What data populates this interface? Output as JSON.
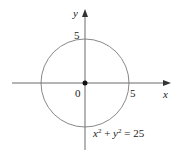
{
  "diagram": {
    "x_axis_label": "x",
    "y_axis_label": "y",
    "origin_label": "0",
    "x_tick_label": "5",
    "y_tick_label": "5",
    "equation": {
      "x_var": "x",
      "x_exp": "2",
      "plus": " + ",
      "y_var": "y",
      "y_exp": "2",
      "rhs": " = 25"
    },
    "circle_radius_units": 5,
    "colors": {
      "axis": "#333333",
      "circle": "#7a7a7a"
    }
  }
}
